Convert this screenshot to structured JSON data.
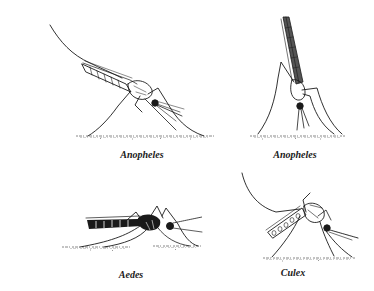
{
  "figure": {
    "background": "#ffffff",
    "ink_color": "#1a1a1a",
    "panels": [
      {
        "id": "anopheles-angled",
        "species": "Anopheles",
        "caption": "Anopheles",
        "posture": "body angled to surface, proboscis and body in a straight line"
      },
      {
        "id": "anopheles-vertical",
        "species": "Anopheles",
        "caption": "Anopheles",
        "posture": "body almost vertical to surface"
      },
      {
        "id": "aedes",
        "species": "Aedes",
        "caption": "Aedes",
        "posture": "body parallel to surface"
      },
      {
        "id": "culex",
        "species": "Culex",
        "caption": "Culex",
        "posture": "body parallel to surface, abdomen bent toward surface"
      }
    ]
  }
}
